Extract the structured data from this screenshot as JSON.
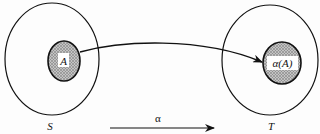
{
  "diagram": {
    "type": "set-mapping",
    "sets": [
      {
        "id": "S",
        "label": "S",
        "subset_label": "A"
      },
      {
        "id": "T",
        "label": "T",
        "subset_label": "α(A)"
      }
    ],
    "mapping": {
      "label": "α",
      "from": "S",
      "to": "T"
    },
    "colors": {
      "stroke": "#111111",
      "shade": "#9a9a9a",
      "background": "#fdfdfd"
    }
  }
}
